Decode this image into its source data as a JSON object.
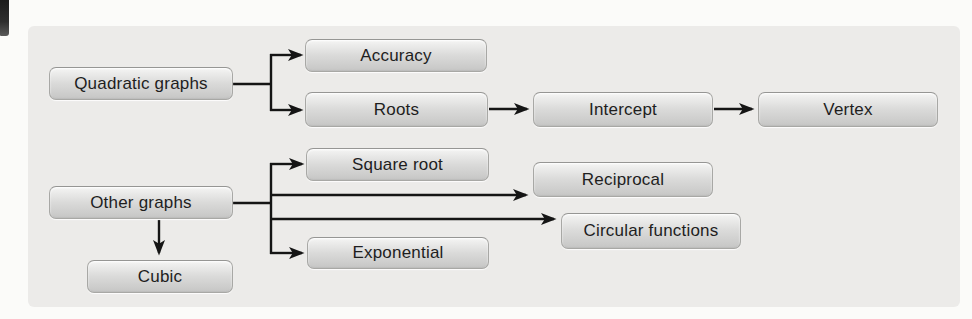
{
  "diagram": {
    "type": "flowchart",
    "topic": "Graph types concept map",
    "nodes": [
      {
        "id": "quadratic-graphs",
        "label": "Quadratic graphs"
      },
      {
        "id": "accuracy",
        "label": "Accuracy"
      },
      {
        "id": "roots",
        "label": "Roots"
      },
      {
        "id": "intercept",
        "label": "Intercept"
      },
      {
        "id": "vertex",
        "label": "Vertex"
      },
      {
        "id": "other-graphs",
        "label": "Other graphs"
      },
      {
        "id": "square-root",
        "label": "Square root"
      },
      {
        "id": "reciprocal",
        "label": "Reciprocal"
      },
      {
        "id": "circular-functions",
        "label": "Circular functions"
      },
      {
        "id": "exponential",
        "label": "Exponential"
      },
      {
        "id": "cubic",
        "label": "Cubic"
      }
    ],
    "edges": [
      {
        "from": "quadratic-graphs",
        "to": "accuracy"
      },
      {
        "from": "quadratic-graphs",
        "to": "roots"
      },
      {
        "from": "roots",
        "to": "intercept"
      },
      {
        "from": "intercept",
        "to": "vertex"
      },
      {
        "from": "other-graphs",
        "to": "square-root"
      },
      {
        "from": "other-graphs",
        "to": "reciprocal"
      },
      {
        "from": "other-graphs",
        "to": "circular-functions"
      },
      {
        "from": "other-graphs",
        "to": "exponential"
      },
      {
        "from": "other-graphs",
        "to": "cubic"
      }
    ],
    "colors": {
      "page_background": "#fbfbf9",
      "panel_background": "#ecebe9",
      "node_fill_top": "#f5f5f4",
      "node_fill_bottom": "#c5c5c4",
      "node_border": "#a8a8a5",
      "connector": "#151515",
      "text": "#1e1e1e"
    }
  }
}
